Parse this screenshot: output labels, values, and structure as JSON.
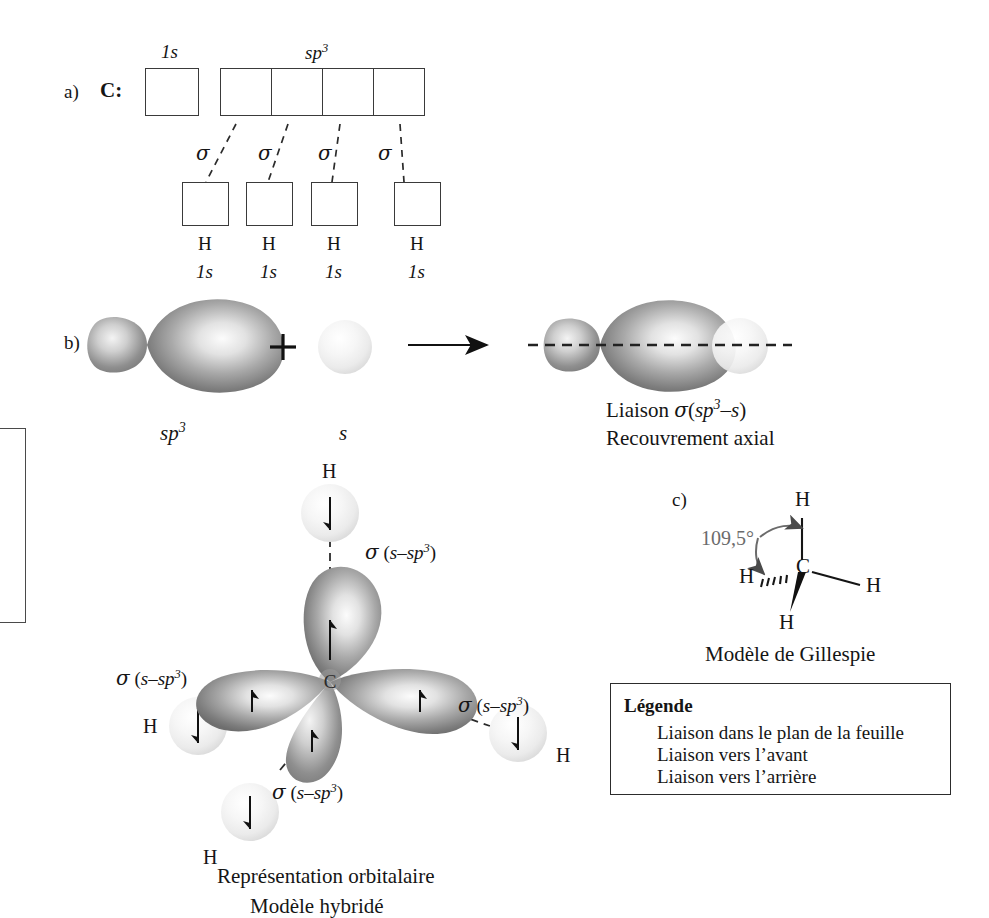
{
  "figure": {
    "background_color": "#ffffff",
    "ink_color": "#151515",
    "gray_label_color": "#6b6b6b"
  },
  "part_a": {
    "marker": "a)",
    "atom_label": "C:",
    "top_orbital_labels": {
      "s_label": "1s",
      "hybrid_label": "sp",
      "hybrid_exponent": "3"
    },
    "top_boxes": [
      {
        "name": "1s",
        "electrons": "up-down"
      },
      {
        "name": "sp3-1",
        "electrons": "up"
      },
      {
        "name": "sp3-2",
        "electrons": "up"
      },
      {
        "name": "sp3-3",
        "electrons": "up"
      },
      {
        "name": "sp3-4",
        "electrons": "up"
      }
    ],
    "bond_labels": [
      "σ",
      "σ",
      "σ",
      "σ"
    ],
    "bottom_boxes": [
      {
        "electrons": "down",
        "atom": "H",
        "orbital": "1s"
      },
      {
        "electrons": "down",
        "atom": "H",
        "orbital": "1s"
      },
      {
        "electrons": "down",
        "atom": "H",
        "orbital": "1s"
      },
      {
        "electrons": "down",
        "atom": "H",
        "orbital": "1s"
      }
    ]
  },
  "part_b": {
    "marker": "b)",
    "left_label_base": "sp",
    "left_label_exp": "3",
    "plus_sign": "+",
    "middle_label": "s",
    "arrow": "→",
    "result_line1_prefix": "Liaison ",
    "result_line1_sigma": "σ",
    "result_line1_paren_open": "(",
    "result_line1_sp": "sp",
    "result_line1_exp": "3",
    "result_line1_dash": "–",
    "result_line1_s": "s",
    "result_line1_paren_close": ")",
    "result_line2": "Recouvrement axial"
  },
  "part_center": {
    "carbon_label": "C",
    "hydrogen_label": "H",
    "sigma_symbol": "σ",
    "sigma_arg_open": "(",
    "sigma_arg_s": "s",
    "sigma_arg_dash": "–",
    "sigma_arg_sp": "sp",
    "sigma_arg_exp": "3",
    "sigma_arg_close": ")",
    "bond_labels": [
      "σ (s–sp3)",
      "σ (s–sp3)",
      "σ (s–sp3)",
      "σ (s–sp3)"
    ],
    "hydrogens": [
      "H",
      "H",
      "H",
      "H"
    ],
    "caption_line1": "Représentation orbitalaire",
    "caption_line2": "Modèle hybridé"
  },
  "part_c": {
    "marker": "c)",
    "angle_label": "109,5°",
    "center_atom": "C",
    "hydrogens": [
      "H",
      "H",
      "H",
      "H"
    ],
    "caption": "Modèle de Gillespie"
  },
  "legend": {
    "title": "Légende",
    "items": [
      {
        "icon": "plain-line-icon",
        "label": "Liaison dans le plan de la feuille"
      },
      {
        "icon": "wedge-solid-icon",
        "label": "Liaison vers l’avant"
      },
      {
        "icon": "wedge-hashed-icon",
        "label": "Liaison vers l’arrière"
      }
    ]
  }
}
